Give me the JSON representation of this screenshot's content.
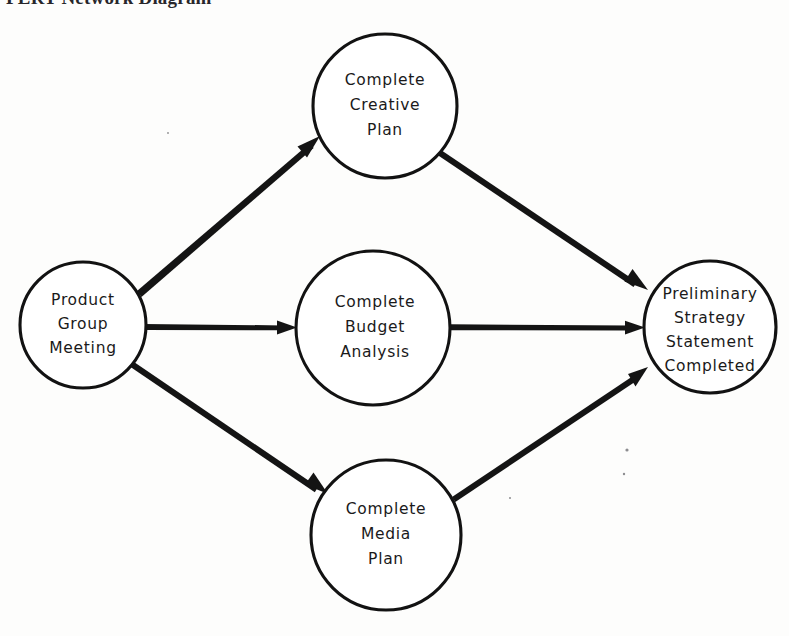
{
  "figure": {
    "title": "PERT Network Diagram",
    "type": "pert-network-diagram",
    "ink_color": "#141414",
    "paper_color": "#fdfdfc"
  },
  "nodes": [
    {
      "id": "product-group-meeting",
      "label_lines": [
        "Product",
        "Group",
        "Meeting"
      ],
      "cx": 83,
      "cy": 325,
      "r": 63
    },
    {
      "id": "complete-creative-plan",
      "label_lines": [
        "Complete",
        "Creative",
        "Plan"
      ],
      "cx": 385,
      "cy": 106,
      "r": 72
    },
    {
      "id": "complete-budget-analysis",
      "label_lines": [
        "Complete",
        "Budget",
        "Analysis"
      ],
      "cx": 373,
      "cy": 328,
      "r": 77
    },
    {
      "id": "complete-media-plan",
      "label_lines": [
        "Complete",
        "Media",
        "Plan"
      ],
      "cx": 386,
      "cy": 535,
      "r": 75
    },
    {
      "id": "preliminary-strategy-statement-completed",
      "label_lines": [
        "Preliminary",
        "Strategy",
        "Statement",
        "Completed"
      ],
      "cx": 710,
      "cy": 327,
      "r": 66
    }
  ],
  "edges": [
    {
      "id": "meeting-to-creative",
      "from": "product-group-meeting",
      "to": "complete-creative-plan"
    },
    {
      "id": "meeting-to-budget",
      "from": "product-group-meeting",
      "to": "complete-budget-analysis"
    },
    {
      "id": "meeting-to-media",
      "from": "product-group-meeting",
      "to": "complete-media-plan"
    },
    {
      "id": "creative-to-strategy",
      "from": "complete-creative-plan",
      "to": "preliminary-strategy-statement-completed"
    },
    {
      "id": "budget-to-strategy",
      "from": "complete-budget-analysis",
      "to": "preliminary-strategy-statement-completed"
    },
    {
      "id": "media-to-strategy",
      "from": "complete-media-plan",
      "to": "preliminary-strategy-statement-completed"
    }
  ]
}
